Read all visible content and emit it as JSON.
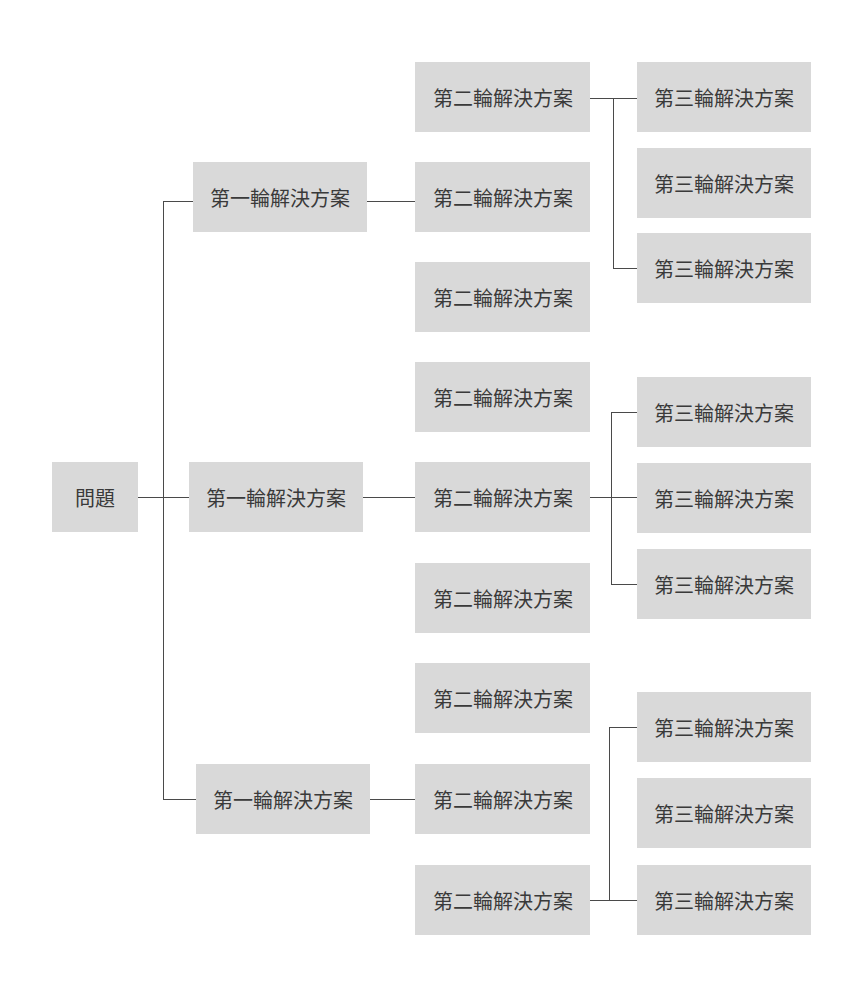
{
  "diagram": {
    "type": "logic-tree",
    "root": {
      "label": "問題"
    },
    "level1": [
      {
        "label": "第一輪解決方案"
      },
      {
        "label": "第一輪解決方案"
      },
      {
        "label": "第一輪解決方案"
      }
    ],
    "level2": [
      {
        "label": "第二輪解決方案"
      },
      {
        "label": "第二輪解決方案"
      },
      {
        "label": "第二輪解決方案"
      },
      {
        "label": "第二輪解決方案"
      },
      {
        "label": "第二輪解決方案"
      },
      {
        "label": "第二輪解決方案"
      },
      {
        "label": "第二輪解決方案"
      },
      {
        "label": "第二輪解決方案"
      },
      {
        "label": "第二輪解決方案"
      }
    ],
    "level3": [
      {
        "label": "第三輪解決方案"
      },
      {
        "label": "第三輪解決方案"
      },
      {
        "label": "第三輪解決方案"
      },
      {
        "label": "第三輪解決方案"
      },
      {
        "label": "第三輪解決方案"
      },
      {
        "label": "第三輪解決方案"
      },
      {
        "label": "第三輪解決方案"
      },
      {
        "label": "第三輪解決方案"
      },
      {
        "label": "第三輪解決方案"
      }
    ],
    "edges": [
      {
        "from": "root",
        "to": "level1.0"
      },
      {
        "from": "root",
        "to": "level1.1"
      },
      {
        "from": "root",
        "to": "level1.2"
      },
      {
        "from": "level1.0",
        "to": "level2.1"
      },
      {
        "from": "level1.1",
        "to": "level2.4"
      },
      {
        "from": "level1.2",
        "to": "level2.7"
      },
      {
        "from": "level2.0",
        "to": "level3.0"
      },
      {
        "from": "level2.0",
        "to": "level3.2"
      },
      {
        "from": "level2.4",
        "to": "level3.3"
      },
      {
        "from": "level2.4",
        "to": "level3.4"
      },
      {
        "from": "level2.4",
        "to": "level3.5"
      },
      {
        "from": "level2.8",
        "to": "level3.6"
      },
      {
        "from": "level2.8",
        "to": "level3.8"
      }
    ],
    "colors": {
      "node_fill": "#d9d9d9",
      "text": "#3a3a3a",
      "line": "#4a4a4a",
      "background": "#ffffff"
    }
  }
}
